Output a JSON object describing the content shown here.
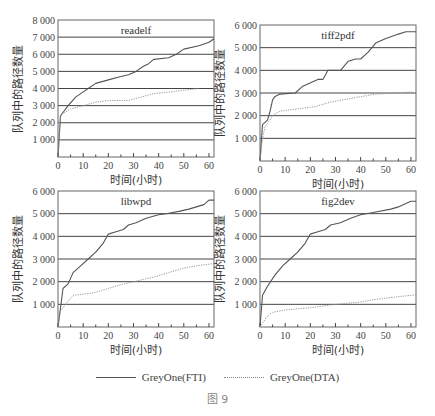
{
  "figure": {
    "caption": "图 9",
    "legend": [
      {
        "label": "GreyOne(FTI)",
        "style": "solid",
        "color": "#555555"
      },
      {
        "label": "GreyOne(DTA)",
        "style": "dotted",
        "color": "#999999"
      }
    ]
  },
  "chart_data": [
    {
      "type": "line",
      "title": "readelf",
      "xlabel": "时间(小时)",
      "ylabel": "队列中的路径数量",
      "xlim": [
        0,
        62
      ],
      "ylim": [
        0,
        8000
      ],
      "xticks": [
        0,
        10,
        20,
        30,
        40,
        50,
        60
      ],
      "yticks": [
        1000,
        2000,
        3000,
        4000,
        5000,
        6000,
        7000,
        8000
      ],
      "ytick_labels": [
        "1 000",
        "2 000",
        "3 000",
        "4 000",
        "5 000",
        "6 000",
        "7 000",
        "8 000"
      ],
      "grid": "horizontal",
      "series": [
        {
          "name": "GreyOne(FTI)",
          "x": [
            0,
            1,
            2,
            4,
            7,
            10,
            12,
            15,
            20,
            25,
            28,
            31,
            34,
            36,
            38,
            44,
            47,
            50,
            56,
            60,
            62
          ],
          "y": [
            0,
            2400,
            2600,
            3000,
            3500,
            3800,
            4000,
            4300,
            4500,
            4700,
            4800,
            5000,
            5300,
            5450,
            5700,
            5800,
            6000,
            6300,
            6500,
            6700,
            6900
          ]
        },
        {
          "name": "GreyOne(DTA)",
          "x": [
            0,
            1,
            2,
            5,
            10,
            15,
            20,
            28,
            33,
            38,
            45,
            50,
            56
          ],
          "y": [
            0,
            2400,
            2550,
            2800,
            3000,
            3200,
            3300,
            3300,
            3500,
            3700,
            3800,
            3900,
            4000
          ]
        }
      ]
    },
    {
      "type": "line",
      "title": "tiff2pdf",
      "xlabel": "时间(小时)",
      "ylabel": "队列中的路径数量",
      "xlim": [
        0,
        62
      ],
      "ylim": [
        0,
        6000
      ],
      "xticks": [
        0,
        10,
        20,
        30,
        40,
        50,
        60
      ],
      "yticks": [
        1000,
        2000,
        3000,
        4000,
        5000,
        6000
      ],
      "ytick_labels": [
        "1 000",
        "2 000",
        "3 000",
        "4 000",
        "5 000",
        "6 000"
      ],
      "grid": "horizontal",
      "series": [
        {
          "name": "GreyOne(FTI)",
          "x": [
            0,
            1,
            3,
            4,
            5,
            6,
            8,
            14,
            17,
            19,
            23,
            25,
            27,
            32,
            35,
            38,
            40,
            43,
            46,
            50,
            55,
            58,
            62
          ],
          "y": [
            0,
            1600,
            1800,
            2200,
            2700,
            2850,
            2950,
            3000,
            3300,
            3400,
            3600,
            3600,
            4000,
            4000,
            4400,
            4500,
            4500,
            4800,
            5200,
            5400,
            5600,
            5700,
            5700
          ]
        },
        {
          "name": "GreyOne(DTA)",
          "x": [
            0,
            1,
            2,
            5,
            8,
            15,
            22,
            28,
            38,
            46,
            55,
            60,
            62
          ],
          "y": [
            0,
            1000,
            1500,
            2000,
            2200,
            2300,
            2400,
            2600,
            2800,
            2950,
            3000,
            3050,
            3000
          ]
        }
      ]
    },
    {
      "type": "line",
      "title": "libwpd",
      "xlabel": "时间(小时)",
      "ylabel": "队列中的路径数量",
      "xlim": [
        0,
        62
      ],
      "ylim": [
        0,
        6000
      ],
      "xticks": [
        0,
        10,
        20,
        30,
        40,
        50,
        60
      ],
      "yticks": [
        1000,
        2000,
        3000,
        4000,
        5000,
        6000
      ],
      "ytick_labels": [
        "1 000",
        "2 000",
        "3 000",
        "4 000",
        "5 000",
        "6 000"
      ],
      "grid": "horizontal",
      "series": [
        {
          "name": "GreyOne(FTI)",
          "x": [
            0,
            2,
            4,
            6,
            9,
            12,
            15,
            18,
            20,
            23,
            26,
            28,
            31,
            35,
            40,
            43,
            48,
            52,
            55,
            58,
            60,
            62
          ],
          "y": [
            0,
            1700,
            1900,
            2400,
            2700,
            3000,
            3300,
            3700,
            4100,
            4200,
            4300,
            4500,
            4600,
            4800,
            4950,
            5000,
            5100,
            5200,
            5300,
            5400,
            5600,
            5600
          ]
        },
        {
          "name": "GreyOne(DTA)",
          "x": [
            0,
            1,
            3,
            6,
            10,
            14,
            20,
            26,
            30,
            34,
            38,
            44,
            50,
            55,
            62
          ],
          "y": [
            0,
            700,
            1000,
            1400,
            1450,
            1500,
            1700,
            1900,
            2000,
            2100,
            2200,
            2400,
            2600,
            2700,
            2800
          ]
        }
      ]
    },
    {
      "type": "line",
      "title": "fig2dev",
      "xlabel": "时间(小时)",
      "ylabel": "队列中的路径数量",
      "xlim": [
        0,
        62
      ],
      "ylim": [
        0,
        6000
      ],
      "xticks": [
        0,
        10,
        20,
        30,
        40,
        50,
        60
      ],
      "yticks": [
        1000,
        2000,
        3000,
        4000,
        5000,
        6000
      ],
      "ytick_labels": [
        "1 000",
        "2 000",
        "3 000",
        "4 000",
        "5 000",
        "6 000"
      ],
      "grid": "horizontal",
      "series": [
        {
          "name": "GreyOne(FTI)",
          "x": [
            0,
            1,
            3,
            6,
            9,
            12,
            15,
            18,
            20,
            23,
            26,
            28,
            32,
            36,
            40,
            45,
            52,
            55,
            58,
            60,
            62
          ],
          "y": [
            0,
            1400,
            1800,
            2300,
            2700,
            3000,
            3300,
            3700,
            4100,
            4200,
            4300,
            4500,
            4600,
            4800,
            4950,
            5050,
            5200,
            5300,
            5450,
            5550,
            5550
          ]
        },
        {
          "name": "GreyOne(DTA)",
          "x": [
            0,
            3,
            5,
            10,
            20,
            30,
            40,
            45,
            52,
            60,
            62
          ],
          "y": [
            0,
            500,
            650,
            750,
            850,
            1000,
            1100,
            1200,
            1300,
            1400,
            1420
          ]
        }
      ]
    }
  ],
  "layout_panels": [
    {
      "left": 58,
      "top": 20,
      "right": 214,
      "bottom": 157
    },
    {
      "left": 260,
      "top": 25,
      "right": 416,
      "bottom": 161
    },
    {
      "left": 58,
      "top": 191,
      "right": 214,
      "bottom": 327
    },
    {
      "left": 260,
      "top": 191,
      "right": 416,
      "bottom": 327
    }
  ]
}
